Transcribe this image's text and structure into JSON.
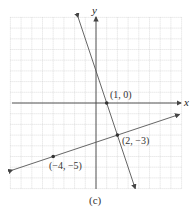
{
  "figure": {
    "caption": "(c)",
    "x_axis_label": "x",
    "y_axis_label": "y"
  },
  "chart_data": {
    "type": "line",
    "title": "",
    "xlabel": "x",
    "ylabel": "y",
    "xlim": [
      -8,
      8
    ],
    "ylim": [
      -8,
      8
    ],
    "grid": true,
    "grid_step": 1,
    "series": [
      {
        "name": "steep line",
        "equation": "y = -3x + 3",
        "slope": -3,
        "intercept": 3,
        "points": [
          {
            "x": 1,
            "y": 0,
            "label": "(1, 0)"
          },
          {
            "x": 2,
            "y": -3,
            "label": "(2, −3)"
          }
        ]
      },
      {
        "name": "shallow line",
        "equation": "y = x/3 - 11/3",
        "slope": 0.3333,
        "intercept": -3.6667,
        "points": [
          {
            "x": -4,
            "y": -5,
            "label": "(−4, −5)"
          },
          {
            "x": 2,
            "y": -3,
            "label": "(2, −3)"
          }
        ]
      }
    ],
    "annotations": [
      "(1, 0)",
      "(2, −3)",
      "(−4, −5)"
    ]
  },
  "labels": {
    "p1": "(1, 0)",
    "p2": "(2, −3)",
    "p3": "(−4, −5)"
  }
}
